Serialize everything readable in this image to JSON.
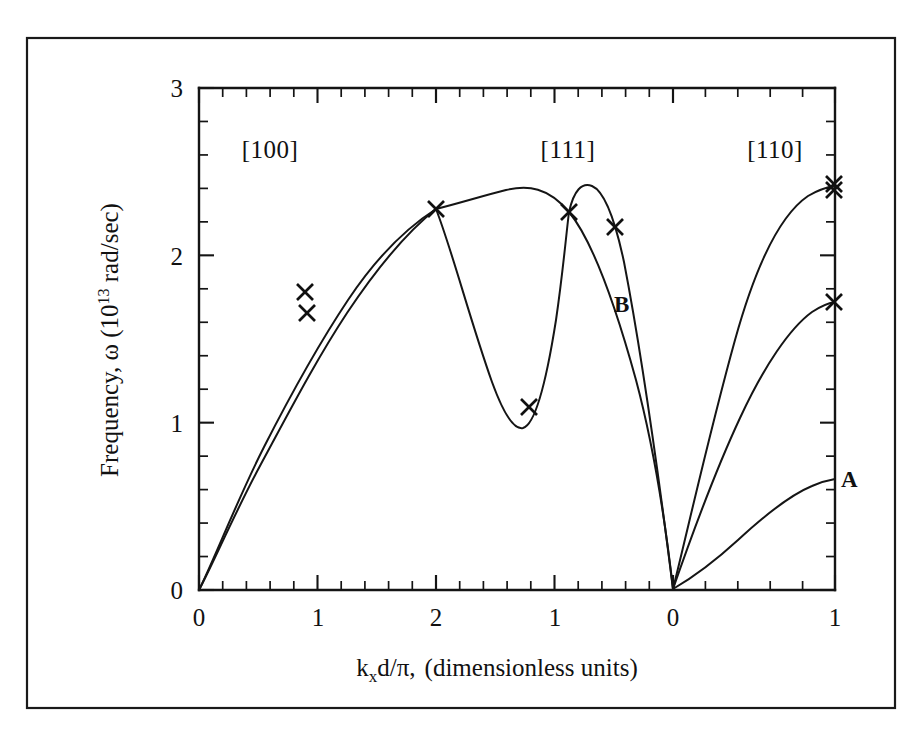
{
  "figure": {
    "title": "",
    "caption": ""
  },
  "chart_data": {
    "type": "line",
    "title": "",
    "subtitle": "",
    "xlabel": "k_x d/π, (dimensionless units)",
    "xlabel_parts": {
      "k": "k",
      "x_sub": "x",
      "d_over_pi": "d/π,",
      "rest": "(dimensionless units)"
    },
    "ylabel": "Frequency, ω (10¹³ rad/sec)",
    "ylabel_parts": {
      "lead": "Frequency, ω (10",
      "exp": "13",
      "tail": " rad/sec)"
    },
    "ylim": [
      0,
      3
    ],
    "y_major_ticks": [
      0,
      1,
      2,
      3
    ],
    "y_minor_step": 0.2,
    "y_ticklabels": [
      "0",
      "1",
      "2",
      "3"
    ],
    "grid": false,
    "legend": "none",
    "axis_style": "ticks-inward-all-sides",
    "x_axis_segments": [
      {
        "name": "[100]",
        "from": 0,
        "to": 2,
        "ticklabels": [
          "0",
          "1",
          "2"
        ],
        "minor_step": 0.2
      },
      {
        "name": "[111]",
        "from": 2,
        "to": 0,
        "ticklabels": [
          "1",
          "0"
        ],
        "minor_step": 0.2
      },
      {
        "name": "[110]",
        "from": 0,
        "to": 1,
        "ticklabels": [
          "1"
        ],
        "minor_step": 0.2
      }
    ],
    "x_ticklabels": [
      "0",
      "1",
      "2",
      "1",
      "0",
      "1"
    ],
    "region_labels": [
      "[100]",
      "[111]",
      "[110]"
    ],
    "branch_labels": [
      {
        "text": "B",
        "region": "[111]",
        "note": "lower optical-like branch in [111]"
      },
      {
        "text": "A",
        "region": "[110]",
        "note": "lowest acoustic branch in [110]"
      }
    ],
    "series": [
      {
        "name": "branch-1-upper",
        "region_sequence": [
          "[100]",
          "[111]",
          "[110]"
        ],
        "points": [
          {
            "x": 0.0,
            "y": 0.0
          },
          {
            "x": 0.2,
            "y": 0.42
          },
          {
            "x": 0.4,
            "y": 0.8
          },
          {
            "x": 0.6,
            "y": 1.14
          },
          {
            "x": 0.8,
            "y": 1.47
          },
          {
            "x": 1.0,
            "y": 1.74
          },
          {
            "x": 1.2,
            "y": 1.96
          },
          {
            "x": 1.4,
            "y": 2.12
          },
          {
            "x": 1.6,
            "y": 2.22
          },
          {
            "x": 1.8,
            "y": 2.27
          },
          {
            "x": 2.0,
            "y": 2.28
          }
        ]
      },
      {
        "name": "branch-2-lower",
        "region_sequence": [
          "[100]"
        ],
        "points": [
          {
            "x": 0.0,
            "y": 0.0
          },
          {
            "x": 0.2,
            "y": 0.36
          },
          {
            "x": 0.4,
            "y": 0.72
          },
          {
            "x": 0.6,
            "y": 1.05
          },
          {
            "x": 0.8,
            "y": 1.36
          },
          {
            "x": 1.0,
            "y": 1.62
          },
          {
            "x": 1.2,
            "y": 1.86
          },
          {
            "x": 1.4,
            "y": 2.06
          },
          {
            "x": 1.6,
            "y": 2.19
          },
          {
            "x": 1.8,
            "y": 2.26
          },
          {
            "x": 2.0,
            "y": 2.28
          }
        ]
      }
    ],
    "data_markers": {
      "symbol": "X",
      "count": 9,
      "points": [
        {
          "region": "[100]",
          "x": 1.0,
          "y": 1.74,
          "label": ""
        },
        {
          "region": "[100]",
          "x": 1.0,
          "y": 1.62,
          "label": ""
        },
        {
          "region": "[100]",
          "x": 2.0,
          "y": 2.28,
          "label": ""
        },
        {
          "region": "[111]",
          "x": 1.33,
          "y": 1.08,
          "label": ""
        },
        {
          "region": "[111]",
          "x": 1.0,
          "y": 2.27,
          "label": ""
        },
        {
          "region": "[111]",
          "x": 0.8,
          "y": 2.18,
          "label": ""
        },
        {
          "region": "[110]",
          "x": 1.0,
          "y": 2.42,
          "label": ""
        },
        {
          "region": "[110]",
          "x": 1.0,
          "y": 2.4,
          "label": ""
        },
        {
          "region": "[110]",
          "x": 1.0,
          "y": 1.62,
          "label": ""
        }
      ]
    },
    "annotations": [
      {
        "text": "[100]",
        "kind": "region-heading"
      },
      {
        "text": "[111]",
        "kind": "region-heading"
      },
      {
        "text": "[110]",
        "kind": "region-heading"
      },
      {
        "text": "B",
        "kind": "branch-tag"
      },
      {
        "text": "A",
        "kind": "branch-tag"
      }
    ]
  }
}
